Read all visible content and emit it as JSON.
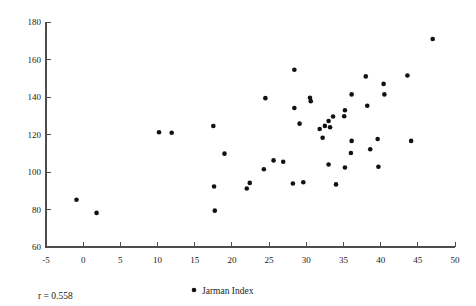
{
  "chart_data": {
    "type": "scatter",
    "title": "",
    "xlabel": "",
    "ylabel": "",
    "xlim": [
      -5,
      50
    ],
    "ylim": [
      60,
      180
    ],
    "xticks": [
      -5,
      0,
      5,
      10,
      15,
      20,
      25,
      30,
      35,
      40,
      45,
      50
    ],
    "yticks": [
      60,
      80,
      100,
      120,
      140,
      160,
      180
    ],
    "xtick_labels": [
      "-5",
      "0",
      "5",
      "10",
      "15",
      "20",
      "25",
      "30",
      "35",
      "40",
      "45",
      "50"
    ],
    "ytick_labels": [
      "60",
      "80",
      "100",
      "120",
      "140",
      "160",
      "180"
    ],
    "grid": false,
    "legend_position": "bottom-center",
    "series": [
      {
        "name": "Jarman Index",
        "marker": "circle",
        "color": "#111111",
        "points": [
          [
            -0.9,
            85.2
          ],
          [
            1.8,
            78.2
          ],
          [
            10.2,
            121.2
          ],
          [
            11.9,
            120.9
          ],
          [
            17.5,
            124.5
          ],
          [
            17.6,
            92.3
          ],
          [
            17.7,
            79.4
          ],
          [
            19.0,
            109.8
          ],
          [
            22.0,
            91.2
          ],
          [
            22.4,
            94.2
          ],
          [
            24.5,
            139.4
          ],
          [
            24.3,
            101.5
          ],
          [
            25.6,
            106.2
          ],
          [
            26.9,
            105.5
          ],
          [
            28.4,
            154.5
          ],
          [
            28.4,
            134.1
          ],
          [
            28.2,
            93.9
          ],
          [
            29.1,
            125.8
          ],
          [
            29.6,
            94.5
          ],
          [
            30.5,
            139.6
          ],
          [
            30.6,
            137.8
          ],
          [
            31.8,
            122.9
          ],
          [
            32.2,
            118.3
          ],
          [
            32.5,
            124.6
          ],
          [
            33.0,
            127.2
          ],
          [
            33.2,
            123.9
          ],
          [
            33.6,
            129.6
          ],
          [
            33.0,
            104.0
          ],
          [
            34.0,
            93.4
          ],
          [
            35.1,
            129.7
          ],
          [
            35.2,
            132.9
          ],
          [
            35.2,
            102.4
          ],
          [
            36.1,
            141.4
          ],
          [
            36.0,
            110.1
          ],
          [
            36.1,
            116.6
          ],
          [
            38.0,
            151.0
          ],
          [
            38.2,
            135.3
          ],
          [
            38.6,
            112.1
          ],
          [
            39.6,
            117.6
          ],
          [
            39.7,
            102.8
          ],
          [
            40.4,
            147.0
          ],
          [
            40.5,
            141.4
          ],
          [
            43.6,
            151.5
          ],
          [
            44.1,
            116.6
          ],
          [
            47.0,
            170.9
          ]
        ]
      }
    ],
    "annotations": [
      {
        "name": "correlation",
        "text": "r = 0.558"
      }
    ],
    "legend": [
      {
        "label": "Jarman Index",
        "marker": "circle",
        "color": "#111111"
      }
    ]
  },
  "style": {
    "axis_color": "#4d4d4d",
    "point_color": "#111111",
    "background": "#ffffff"
  }
}
